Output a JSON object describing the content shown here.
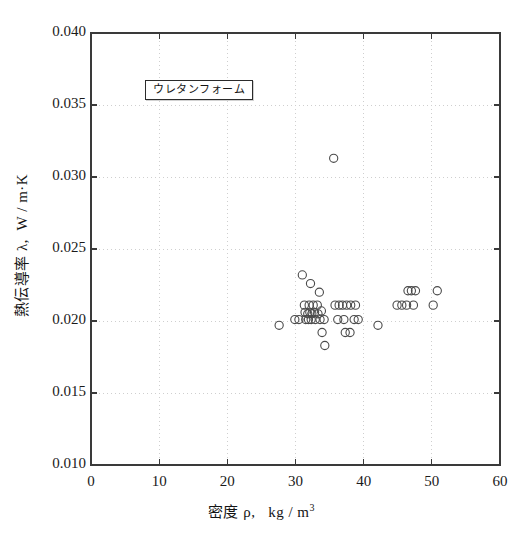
{
  "figure": {
    "background_color": "#ffffff",
    "frame_color": "#3a3a3a",
    "grid_color": "#cfcfcf",
    "marker_color": "#4a4a4a",
    "text_color": "#141414"
  },
  "legend": {
    "label": "ウレタンフォーム"
  },
  "axes": {
    "y_title_main": "熱伝導率",
    "y_title_symbol": "λ,",
    "y_title_unit": "W / m·K",
    "x_title_main": "密度",
    "x_title_symbol": "ρ,",
    "x_title_unit": "kg / m",
    "x_title_unit_exponent": "3"
  },
  "chart_data": {
    "type": "scatter",
    "title": "",
    "subtitle": "",
    "xlabel": "密度 ρ,  kg/m³",
    "ylabel": "熱伝導率 λ,  W/m·K",
    "xlim": [
      0,
      60
    ],
    "ylim": [
      0.01,
      0.04
    ],
    "xticks": [
      0,
      10,
      20,
      30,
      40,
      50,
      60
    ],
    "yticks": [
      0.01,
      0.015,
      0.02,
      0.025,
      0.03,
      0.035,
      0.04
    ],
    "xtick_labels": [
      "0",
      "10",
      "20",
      "30",
      "40",
      "50",
      "60"
    ],
    "ytick_labels": [
      "0.010",
      "0.015",
      "0.020",
      "0.025",
      "0.030",
      "0.035",
      "0.040"
    ],
    "grid": true,
    "grid_style": "dotted",
    "legend_position": "upper-left-inside",
    "marker": "open-circle",
    "series": [
      {
        "name": "ウレタンフォーム",
        "points": [
          [
            27.6,
            0.0197
          ],
          [
            29.9,
            0.0201
          ],
          [
            30.5,
            0.0201
          ],
          [
            31.0,
            0.0232
          ],
          [
            31.3,
            0.0211
          ],
          [
            31.4,
            0.0206
          ],
          [
            31.5,
            0.0201
          ],
          [
            31.8,
            0.0205
          ],
          [
            31.9,
            0.0201
          ],
          [
            32.0,
            0.0211
          ],
          [
            32.1,
            0.0206
          ],
          [
            32.2,
            0.0226
          ],
          [
            32.3,
            0.0201
          ],
          [
            32.4,
            0.0205
          ],
          [
            32.6,
            0.0211
          ],
          [
            32.8,
            0.0206
          ],
          [
            32.9,
            0.0201
          ],
          [
            33.2,
            0.0211
          ],
          [
            33.3,
            0.0205
          ],
          [
            33.5,
            0.022
          ],
          [
            33.6,
            0.0201
          ],
          [
            33.8,
            0.0207
          ],
          [
            33.9,
            0.0192
          ],
          [
            34.2,
            0.0201
          ],
          [
            34.3,
            0.0183
          ],
          [
            35.6,
            0.0313
          ],
          [
            35.8,
            0.0211
          ],
          [
            36.2,
            0.0201
          ],
          [
            36.4,
            0.0211
          ],
          [
            36.9,
            0.0211
          ],
          [
            37.1,
            0.0201
          ],
          [
            37.3,
            0.0192
          ],
          [
            37.5,
            0.0211
          ],
          [
            38.0,
            0.0192
          ],
          [
            38.1,
            0.0211
          ],
          [
            38.6,
            0.0201
          ],
          [
            38.8,
            0.0211
          ],
          [
            39.2,
            0.0201
          ],
          [
            42.1,
            0.0197
          ],
          [
            44.9,
            0.0211
          ],
          [
            45.6,
            0.0211
          ],
          [
            46.3,
            0.0211
          ],
          [
            46.5,
            0.0221
          ],
          [
            47.0,
            0.0221
          ],
          [
            47.3,
            0.0211
          ],
          [
            47.6,
            0.0221
          ],
          [
            50.2,
            0.0211
          ],
          [
            50.8,
            0.0221
          ]
        ]
      }
    ]
  }
}
